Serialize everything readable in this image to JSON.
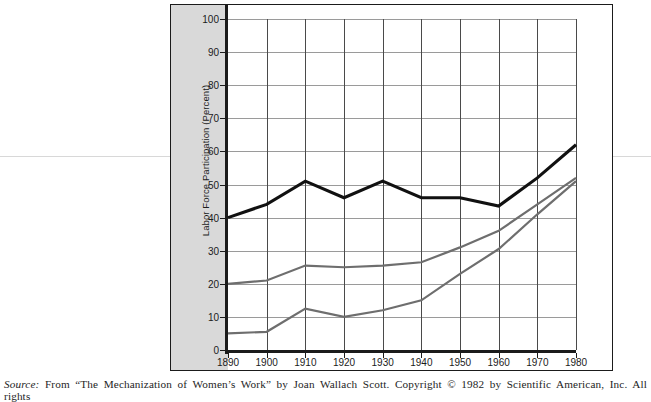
{
  "figure": {
    "y_axis_title": "Labor Force Participation (Percent)",
    "source_prefix": "Source:",
    "source_text": "From “The Mechanization of Women’s Work” by Joan Wallach Scott. Copyright © 1982 by Scientific American, Inc. All rights"
  },
  "chart_data": {
    "type": "line",
    "title": "",
    "xlabel": "",
    "ylabel": "Labor Force Participation (Percent)",
    "x": [
      1890,
      1900,
      1910,
      1920,
      1930,
      1940,
      1950,
      1960,
      1970,
      1980
    ],
    "xtick_labels": [
      "1890",
      "1900",
      "1910",
      "1920",
      "1930",
      "1940",
      "1950",
      "1960",
      "1970",
      "1980"
    ],
    "ytick_labels": [
      "0",
      "10",
      "20",
      "30",
      "40",
      "50",
      "60",
      "70",
      "80",
      "90",
      "100"
    ],
    "ylim": [
      0,
      100
    ],
    "xlim": [
      1890,
      1980
    ],
    "grid": true,
    "legend": "none",
    "series": [
      {
        "name": "series-black",
        "color": "#111111",
        "width": 3.1,
        "values": [
          40,
          44,
          51,
          46,
          51,
          46,
          46,
          43.5,
          52,
          62
        ]
      },
      {
        "name": "series-gray-upper",
        "color": "#6e6e6e",
        "width": 2.2,
        "values": [
          20,
          21,
          25.5,
          25,
          25.5,
          26.5,
          31,
          36,
          44,
          52
        ]
      },
      {
        "name": "series-gray-lower",
        "color": "#6e6e6e",
        "width": 2.2,
        "values": [
          5,
          5.5,
          12.5,
          10,
          12,
          15,
          23,
          30.5,
          41,
          51
        ]
      }
    ]
  }
}
